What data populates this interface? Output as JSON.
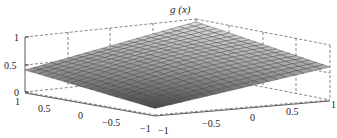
{
  "chart_data": {
    "type": "surface",
    "title": "g (x)",
    "xlabel": "",
    "ylabel": "",
    "zlabel": "",
    "x_ticks": [
      "-1",
      "-0.5",
      "0",
      "0.5",
      "1"
    ],
    "y_ticks": [
      "1",
      "0.5",
      "0",
      "-0.5",
      "-1"
    ],
    "z_ticks": [
      "0",
      "0.5",
      "1"
    ],
    "xlim": [
      -1,
      1
    ],
    "ylim": [
      -1,
      1
    ],
    "zlim": [
      0,
      1
    ],
    "grid": true,
    "box": "dashed",
    "colormap": "gray",
    "corner_values": {
      "back_peak": 0.95,
      "left_corner": 0.4,
      "right_corner": 0.6,
      "front_corner": 0.12
    },
    "mesh_resolution": 21
  },
  "labels": {
    "title": "g (x)",
    "z": [
      "1",
      "0.5",
      "0"
    ],
    "left_axis": [
      "1",
      "0.5",
      "0",
      "−0.5",
      "−1"
    ],
    "right_axis": [
      "−1",
      "−0.5",
      "0",
      "0.5",
      "1"
    ]
  }
}
